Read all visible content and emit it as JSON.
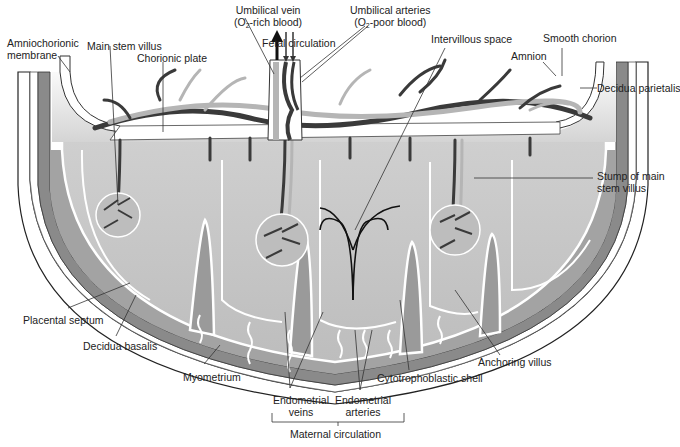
{
  "diagram": {
    "colors": {
      "background": "#ffffff",
      "uterine_wall": "#7d7d7d",
      "decidua": "#9a9a9a",
      "intervillous": "#c2c2c2",
      "chorionic_top": "#e6e6e6",
      "vessel_dark": "#3a3a3a",
      "vessel_light": "#b5b5b5",
      "membrane": "#ffffff",
      "leader_line": "#333333"
    }
  },
  "labels": {
    "umbilical_vein": {
      "line1": "Umbilical vein",
      "line2_pre": "(O",
      "line2_sub": "2",
      "line2_post": "-rich blood)"
    },
    "umbilical_arteries": {
      "line1": "Umbilical arteries",
      "line2_pre": "(O",
      "line2_sub": "2",
      "line2_post": "-poor blood)"
    },
    "fetal_circulation": "Fetal circulation",
    "amniochorionic_membrane": {
      "line1": "Amniochorionic",
      "line2": "membrane"
    },
    "main_stem_villus": "Main stem villus",
    "chorionic_plate": "Chorionic plate",
    "intervillous_space": "Intervillous space",
    "smooth_chorion": "Smooth chorion",
    "amnion": "Amnion",
    "decidua_parietalis": "Decidua parietalis",
    "stump_of_main_stem_villus": {
      "line1": "Stump of main",
      "line2": "stem villus"
    },
    "placental_septum": "Placental septum",
    "decidua_basalis": "Decidua basalis",
    "myometrium": "Myometrium",
    "endometrial_veins": {
      "line1": "Endometrial",
      "line2": "veins"
    },
    "endometrial_arteries": {
      "line1": "Endometrial",
      "line2": "arteries"
    },
    "cytotrophoblastic_shell": "Cytotrophoblastic shell",
    "anchoring_villus": "Anchoring villus",
    "maternal_circulation": "Maternal circulation"
  }
}
